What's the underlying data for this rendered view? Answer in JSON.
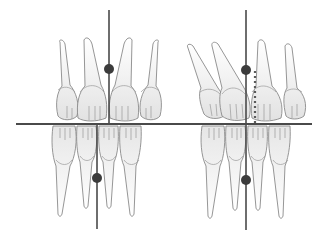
{
  "diagram": {
    "title": "",
    "type": "dental-midline-comparison",
    "colors": {
      "background": "#ffffff",
      "tooth_outline": "#8a8a8a",
      "tooth_fill_top": "#ffffff",
      "tooth_fill_bottom": "#e4e4e4",
      "reference_line": "#4a4a4a",
      "midline_marker": "#3c3c3c",
      "deviation_line": "#5a5a5a"
    },
    "occlusal_plane": {
      "x1": 16,
      "x2": 312,
      "y": 124
    },
    "panels": [
      {
        "name": "aligned-midlines",
        "upper_midline": {
          "x": 109,
          "y_top": 10,
          "y_bottom": 124,
          "marker_y": 69
        },
        "lower_midline": {
          "x": 97,
          "y_top": 124,
          "y_bottom": 229,
          "marker_y": 178
        },
        "deviation": null
      },
      {
        "name": "shifted-midlines",
        "upper_midline": {
          "x": 246,
          "y_top": 10,
          "y_bottom": 124,
          "marker_y": 70
        },
        "lower_midline": {
          "x": 246,
          "y_top": 124,
          "y_bottom": 230,
          "marker_y": 180
        },
        "deviation": {
          "x": 255,
          "y_top": 70,
          "y_bottom": 124,
          "style": "dotted"
        }
      }
    ]
  }
}
